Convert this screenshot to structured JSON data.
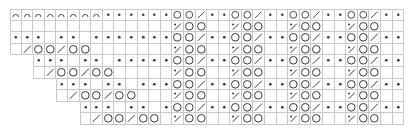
{
  "chart": {
    "title": "",
    "columns": 34,
    "rows": 10,
    "colors": {
      "grid": "#c8c8c8",
      "symbol": "#333333"
    },
    "legend": {
      "a": "bind-off-arch",
      "p": "purl-dot",
      "o": "yarn-over-circle",
      "k": "decrease-slash",
      "s": "decrease-slash-with-dot",
      "e": "empty",
      "x": "no-stitch"
    },
    "grid": [
      "aaaaaaaappppppookppookppookppookpp",
      "eeeeeeeeeeeeeesooeesooeesooeesooee",
      "pppeppepppppppookppookppookppookpp",
      "ekookooeeeeeeesooeesooeesooeesooee",
      "xxpppeppepppppookppookppookppookpp",
      "xxekookooeeeeesooeesooeesooeesooee",
      "xxxxpppeppepppookppookppookppookpp",
      "xxxxekookooeeesooeesooeesooeesooee",
      "xxxxxxpppeppepookppookppookppookpp",
      "xxxxxxekookooesooeesooeesooeesooee"
    ]
  }
}
